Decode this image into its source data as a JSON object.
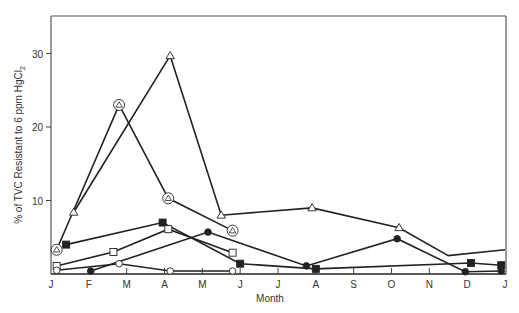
{
  "chart_data": {
    "type": "line",
    "title": "",
    "xlabel": "Month",
    "ylabel": "% of TVC Resistant to 6 ppm HgCl2",
    "ylabel_parts": {
      "main": "% of TVC Resistant to 6 ppm HgCl",
      "sub": "2"
    },
    "x_ticks": [
      "J",
      "F",
      "M",
      "A",
      "M",
      "J",
      "J",
      "A",
      "S",
      "O",
      "N",
      "D",
      "J"
    ],
    "y_ticks": [
      10,
      20,
      30
    ],
    "xlim": [
      0,
      12
    ],
    "ylim": [
      0,
      35
    ],
    "grid": false,
    "legend": null,
    "series": [
      {
        "name": "circled-open-triangle",
        "marker": "circled-triangle",
        "x": [
          0.15,
          1.8,
          3.1,
          4.8
        ],
        "y": [
          3.3,
          23.0,
          10.3,
          5.9
        ]
      },
      {
        "name": "open-triangle",
        "marker": "open-triangle",
        "x": [
          0.6,
          3.15
        ],
        "y": [
          8.4,
          29.7
        ],
        "connects_to": "filled-triangle"
      },
      {
        "name": "filled-triangle-then-open-triangle",
        "marker_sequence": [
          "filled-triangle",
          "open-triangle",
          "open-triangle",
          "open-triangle",
          "none"
        ],
        "x": [
          3.15,
          4.5,
          6.9,
          9.2,
          10.5,
          12.0
        ],
        "y": [
          29.7,
          8.0,
          9.0,
          6.3,
          2.5,
          3.3
        ]
      },
      {
        "name": "filled-square",
        "marker": "filled-square",
        "x": [
          0.4,
          2.95,
          5.0,
          7.0,
          11.1,
          11.9
        ],
        "y": [
          4.0,
          7.0,
          1.4,
          0.7,
          1.5,
          1.2
        ]
      },
      {
        "name": "open-square",
        "marker": "open-square",
        "x": [
          0.15,
          1.65,
          3.1,
          4.8
        ],
        "y": [
          1.1,
          3.0,
          6.1,
          2.9
        ]
      },
      {
        "name": "filled-circle",
        "marker": "filled-circle",
        "x": [
          1.05,
          4.15,
          6.75,
          9.15,
          10.95,
          11.9
        ],
        "y": [
          0.4,
          5.7,
          1.1,
          4.8,
          0.3,
          0.4
        ]
      },
      {
        "name": "open-circle",
        "marker": "open-circle",
        "x": [
          0.15,
          1.8,
          3.15,
          4.8
        ],
        "y": [
          0.5,
          1.4,
          0.4,
          0.4
        ]
      }
    ]
  }
}
